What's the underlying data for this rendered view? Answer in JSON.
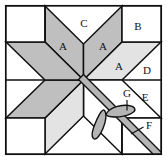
{
  "figure": {
    "kind": "quilt-block-diagram",
    "name": "Eight-pointed LeMoyne star block with appliqué",
    "caption": ""
  },
  "canvas": {
    "width": 167,
    "height": 168
  },
  "frame": {
    "x": 5,
    "y": 5,
    "width": 157,
    "height": 150,
    "stroke": "#111111",
    "stroke_width": 1.6,
    "fill": "#ffffff"
  },
  "colors": {
    "background": "#ffffff",
    "outline": "#111111",
    "diamond_dark": "#bfbfbf",
    "diamond_light": "#e3e3e3",
    "stripe": "#b5b5b5",
    "leaf": "#b5b5b5",
    "plain": "#ffffff",
    "caption_text": "#cfcfcf"
  },
  "geometry": {
    "center": {
      "x": 83.5,
      "y": 80
    },
    "star_points": 8,
    "notes": "Star diamonds radiate from centre; corners are plain squares; edges are plain triangles."
  },
  "pieces": [
    {
      "id": "A",
      "label": "A",
      "role": "star-diamond",
      "shade": "dark",
      "label_x": 63,
      "label_y": 47
    },
    {
      "id": "A2",
      "label": "A",
      "role": "star-diamond",
      "shade": "dark",
      "label_x": 103,
      "label_y": 47
    },
    {
      "id": "A3",
      "label": "A",
      "role": "star-diamond",
      "shade": "light",
      "label_x": 119,
      "label_y": 67
    },
    {
      "id": "C",
      "label": "C",
      "role": "edge-triangle-top",
      "shade": "plain",
      "label_x": 84,
      "label_y": 24
    },
    {
      "id": "B",
      "label": "B",
      "role": "corner-square",
      "shade": "plain",
      "label_x": 138,
      "label_y": 27
    },
    {
      "id": "D",
      "label": "D",
      "role": "edge-triangle-right",
      "shade": "plain",
      "label_x": 147,
      "label_y": 71
    },
    {
      "id": "E",
      "label": "E",
      "role": "corner-square",
      "shade": "plain",
      "label_x": 145,
      "label_y": 98
    },
    {
      "id": "F",
      "label": "F",
      "role": "diagonal-stripe",
      "shade": "stripe",
      "label_x": 148,
      "label_y": 126
    },
    {
      "id": "G",
      "label": "G",
      "role": "applique-leaf",
      "shade": "leaf",
      "label_x": 127,
      "label_y": 94
    }
  ],
  "leader_lines": [
    {
      "from": "G",
      "x1": 127,
      "y1": 100,
      "x2": 127,
      "y2": 111
    },
    {
      "from": "F",
      "x1": 143,
      "y1": 127,
      "x2": 131,
      "y2": 134
    }
  ],
  "legend": {
    "A": "Star diamond",
    "B": "Corner square",
    "C": "Top edge triangle",
    "D": "Right edge triangle",
    "E": "Corner square",
    "F": "Diagonal stripe / binding",
    "G": "Appliqué leaf"
  }
}
